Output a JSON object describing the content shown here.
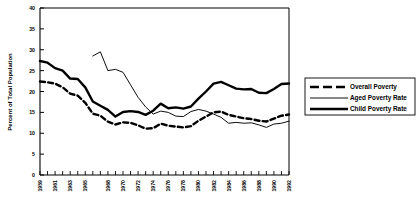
{
  "chart_data": {
    "type": "line",
    "title": "",
    "xlabel": "",
    "ylabel": "Percent of Total Population",
    "ylim": [
      0,
      40
    ],
    "xlim": [
      1959,
      1992
    ],
    "yticks": [
      0,
      5,
      10,
      15,
      20,
      25,
      30,
      35,
      40
    ],
    "ytick_labels": [
      "0",
      "5",
      "10",
      "15",
      "20",
      "25",
      "30",
      "35",
      "40"
    ],
    "xtick_labels": [
      "1959",
      "1961",
      "1963",
      "1965",
      "1968",
      "1970",
      "1972",
      "1974",
      "1976",
      "1978",
      "1980",
      "1982",
      "1984",
      "1986",
      "1988",
      "1990",
      "1992"
    ],
    "xtick_years": [
      1959,
      1961,
      1963,
      1965,
      1968,
      1970,
      1972,
      1974,
      1976,
      1978,
      1980,
      1982,
      1984,
      1986,
      1988,
      1990,
      1992
    ],
    "grid": false,
    "legend_position": "right-outside",
    "legend_entries": [
      "Overall Poverty",
      "Aged Poverty Rate",
      "Child Poverty Rate"
    ],
    "series": [
      {
        "name": "Overall Poverty",
        "style": "dashed",
        "color": "#000000",
        "x": [
          1959,
          1960,
          1961,
          1962,
          1963,
          1964,
          1965,
          1966,
          1967,
          1968,
          1969,
          1970,
          1971,
          1972,
          1973,
          1974,
          1975,
          1976,
          1977,
          1978,
          1979,
          1980,
          1981,
          1982,
          1983,
          1984,
          1985,
          1986,
          1987,
          1988,
          1989,
          1990,
          1991,
          1992
        ],
        "values": [
          22.4,
          22.2,
          21.9,
          21.0,
          19.5,
          19.0,
          17.3,
          14.7,
          14.2,
          12.8,
          12.1,
          12.6,
          12.5,
          11.9,
          11.1,
          11.2,
          12.3,
          11.8,
          11.6,
          11.4,
          11.7,
          13.0,
          14.0,
          15.0,
          15.2,
          14.4,
          14.0,
          13.6,
          13.4,
          13.0,
          12.8,
          13.5,
          14.2,
          14.5
        ]
      },
      {
        "name": "Aged Poverty Rate",
        "style": "thin",
        "color": "#000000",
        "x": [
          1966,
          1967,
          1968,
          1969,
          1970,
          1971,
          1972,
          1973,
          1974,
          1975,
          1976,
          1977,
          1978,
          1979,
          1980,
          1981,
          1982,
          1983,
          1984,
          1985,
          1986,
          1987,
          1988,
          1989,
          1990,
          1991,
          1992
        ],
        "values": [
          28.5,
          29.5,
          25.0,
          25.3,
          24.6,
          21.6,
          18.6,
          16.3,
          14.6,
          15.3,
          15.0,
          14.1,
          14.0,
          15.2,
          15.7,
          15.3,
          14.6,
          13.8,
          12.4,
          12.6,
          12.4,
          12.5,
          12.0,
          11.4,
          12.2,
          12.4,
          12.9
        ]
      },
      {
        "name": "Child Poverty Rate",
        "style": "thick",
        "color": "#000000",
        "x": [
          1959,
          1960,
          1961,
          1962,
          1963,
          1964,
          1965,
          1966,
          1967,
          1968,
          1969,
          1970,
          1971,
          1972,
          1973,
          1974,
          1975,
          1976,
          1977,
          1978,
          1979,
          1980,
          1981,
          1982,
          1983,
          1984,
          1985,
          1986,
          1987,
          1988,
          1989,
          1990,
          1991,
          1992
        ],
        "values": [
          27.3,
          26.9,
          25.6,
          25.0,
          23.1,
          23.0,
          21.0,
          17.6,
          16.6,
          15.6,
          14.0,
          15.1,
          15.3,
          15.1,
          14.4,
          15.4,
          17.1,
          16.0,
          16.2,
          15.9,
          16.4,
          18.3,
          20.0,
          21.9,
          22.3,
          21.5,
          20.7,
          20.5,
          20.6,
          19.7,
          19.6,
          20.6,
          21.8,
          21.9
        ]
      }
    ]
  },
  "axis": {
    "ylabel": "Percent of Total Population"
  },
  "legend": {
    "items": [
      {
        "label": "Overall Poverty",
        "style": "dashed"
      },
      {
        "label": "Aged Poverty Rate",
        "style": "thin"
      },
      {
        "label": "Child Poverty Rate",
        "style": "thick"
      }
    ]
  }
}
